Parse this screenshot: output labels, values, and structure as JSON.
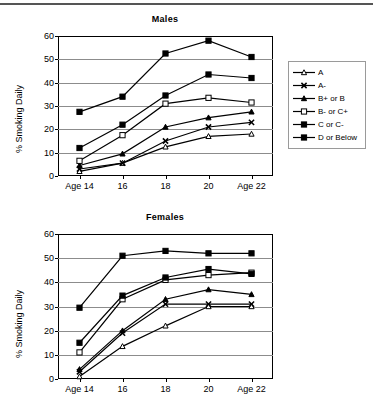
{
  "figure": {
    "ylabel": "% Smoking Daily",
    "x_categories": [
      "Age 14",
      "16",
      "18",
      "20",
      "Age 22"
    ],
    "y_ticks": [
      0,
      10,
      20,
      30,
      40,
      50,
      60
    ]
  },
  "legend": {
    "position": "right-of-top-panel",
    "entries": [
      {
        "label": "A",
        "marker": "open-triangle"
      },
      {
        "label": "A-",
        "marker": "x-cross"
      },
      {
        "label": "B+ or B",
        "marker": "filled-triangle"
      },
      {
        "label": "B- or C+",
        "marker": "open-square"
      },
      {
        "label": "C or C-",
        "marker": "filled-square"
      },
      {
        "label": "D or Below",
        "marker": "filled-square"
      }
    ]
  },
  "chart_data": [
    {
      "type": "line",
      "title": "Males",
      "xlabel": "",
      "ylabel": "% Smoking Daily",
      "categories": [
        "Age 14",
        "16",
        "18",
        "20",
        "Age 22"
      ],
      "ylim": [
        0,
        60
      ],
      "grid": true,
      "legend": "right",
      "series": [
        {
          "name": "A",
          "marker": "open-triangle",
          "values": [
            2.0,
            5.5,
            12.5,
            17.0,
            18.0
          ]
        },
        {
          "name": "A-",
          "marker": "x-cross",
          "values": [
            3.0,
            5.5,
            15.0,
            21.0,
            23.0
          ]
        },
        {
          "name": "B+ or B",
          "marker": "filled-triangle",
          "values": [
            4.5,
            9.5,
            21.0,
            25.0,
            27.5
          ]
        },
        {
          "name": "B- or C+",
          "marker": "open-square",
          "values": [
            6.5,
            17.5,
            31.0,
            33.5,
            31.5
          ]
        },
        {
          "name": "C or C-",
          "marker": "filled-square",
          "values": [
            12.0,
            22.0,
            34.5,
            43.5,
            42.0
          ]
        },
        {
          "name": "D or Below",
          "marker": "filled-square",
          "values": [
            27.5,
            34.0,
            52.5,
            58.0,
            51.0
          ]
        }
      ]
    },
    {
      "type": "line",
      "title": "Females",
      "xlabel": "",
      "ylabel": "% Smoking Daily",
      "categories": [
        "Age 14",
        "16",
        "18",
        "20",
        "Age 22"
      ],
      "ylim": [
        0,
        60
      ],
      "grid": true,
      "legend": "none",
      "series": [
        {
          "name": "A",
          "marker": "open-triangle",
          "values": [
            1.0,
            13.5,
            22.0,
            30.0,
            30.0
          ]
        },
        {
          "name": "A-",
          "marker": "x-cross",
          "values": [
            3.0,
            19.0,
            31.0,
            31.0,
            31.0
          ]
        },
        {
          "name": "B+ or B",
          "marker": "filled-triangle",
          "values": [
            4.0,
            20.0,
            33.0,
            37.0,
            35.0
          ]
        },
        {
          "name": "B- or C+",
          "marker": "open-square",
          "values": [
            11.0,
            33.0,
            41.0,
            43.0,
            44.0
          ]
        },
        {
          "name": "C or C-",
          "marker": "filled-square",
          "values": [
            15.0,
            34.5,
            42.0,
            45.5,
            43.5
          ]
        },
        {
          "name": "D or Below",
          "marker": "filled-square",
          "values": [
            29.5,
            51.0,
            53.0,
            52.0,
            52.0
          ]
        }
      ]
    }
  ]
}
